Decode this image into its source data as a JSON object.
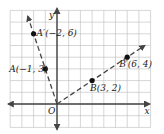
{
  "diagram": {
    "grid": {
      "x_range": [
        -4,
        8
      ],
      "y_range": [
        -2,
        8
      ],
      "step": 1
    },
    "axes": {
      "x_label": "x",
      "y_label": "y",
      "origin_label": "O"
    },
    "colors": {
      "grid": "#bbbbbb",
      "axis": "#444444",
      "line": "#444444",
      "point": "#111111"
    },
    "points": [
      {
        "id": "A",
        "label": "A(−1, 3)",
        "x": -1,
        "y": 3
      },
      {
        "id": "A_prime",
        "label": "A′(−2, 6)",
        "x": -2,
        "y": 6
      },
      {
        "id": "B",
        "label": "B(3, 2)",
        "x": 3,
        "y": 2
      },
      {
        "id": "B_prime",
        "label": "B′(6, 4)",
        "x": 6,
        "y": 4
      }
    ],
    "rays": [
      {
        "from": [
          0,
          0
        ],
        "through": [
          -2,
          6
        ],
        "style": "dashed"
      },
      {
        "from": [
          0,
          0
        ],
        "through": [
          6,
          4
        ],
        "style": "dashed"
      }
    ]
  }
}
